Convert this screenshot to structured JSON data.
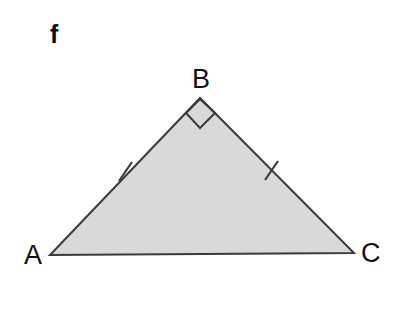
{
  "figure": {
    "part_label": "f",
    "background_color": "#ffffff",
    "shape": {
      "name": "triangle",
      "fill_color": "#d9d9d9",
      "stroke_color": "#3a3a3a",
      "stroke_width": 2,
      "vertices": [
        {
          "name": "A",
          "label": "A",
          "x": 50,
          "y": 255
        },
        {
          "name": "B",
          "label": "B",
          "x": 200,
          "y": 98
        },
        {
          "name": "C",
          "label": "C",
          "x": 354,
          "y": 253
        }
      ],
      "sides": [
        {
          "name": "AB",
          "from": "A",
          "to": "B",
          "tick_marks": 1
        },
        {
          "name": "BC",
          "from": "B",
          "to": "C",
          "tick_marks": 1
        },
        {
          "name": "AC",
          "from": "A",
          "to": "C",
          "tick_marks": 0
        }
      ],
      "angle_markers": [
        {
          "name": "right-angle-at-B",
          "vertex": "B",
          "type": "right-angle-square",
          "points": "200,99 186,113 200,128 215,113"
        }
      ],
      "tick_marks": [
        {
          "name": "tick-AB",
          "on_side": "AB",
          "x1": 119,
          "y1": 181,
          "x2": 132,
          "y2": 162
        },
        {
          "name": "tick-BC",
          "on_side": "BC",
          "x1": 265,
          "y1": 180,
          "x2": 278,
          "y2": 161
        }
      ]
    },
    "labels": {
      "A": "A",
      "B": "B",
      "C": "C"
    }
  }
}
